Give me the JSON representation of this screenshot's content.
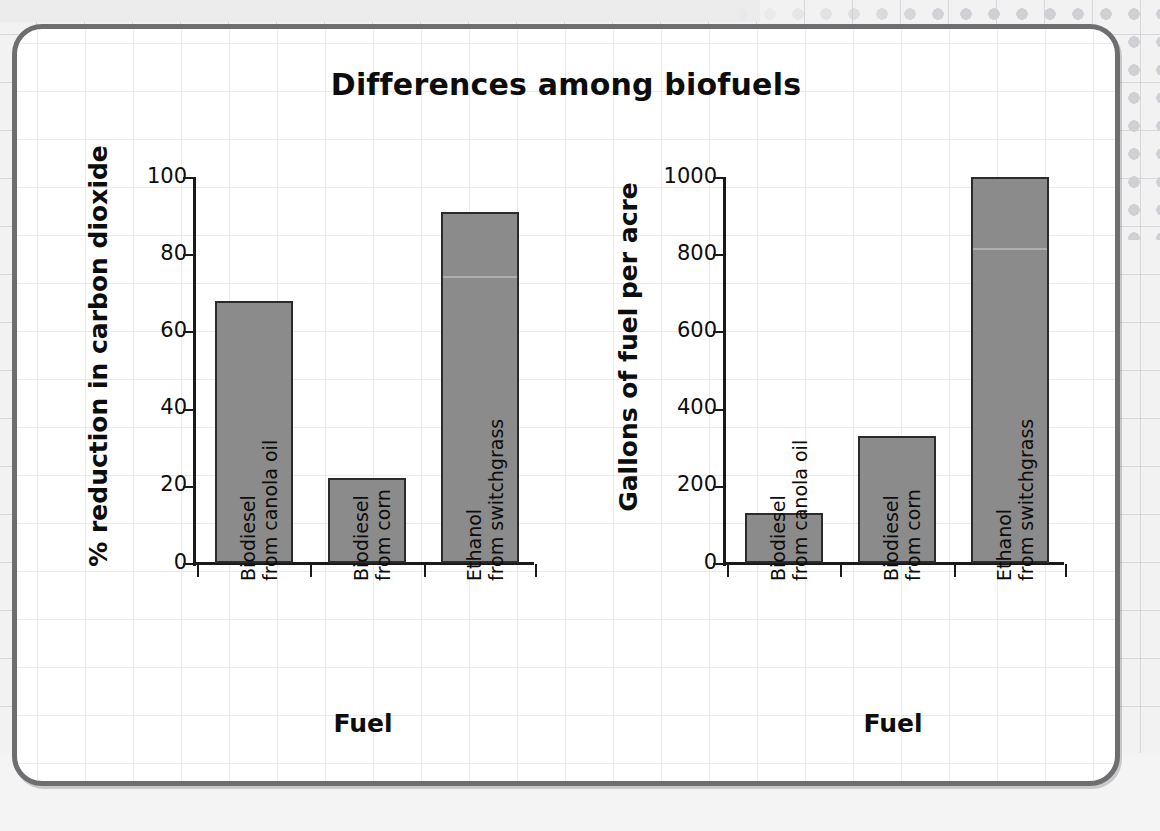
{
  "slide": {
    "title": "Differences among biofuels"
  },
  "chart_data": [
    {
      "id": "left",
      "type": "bar",
      "title": "",
      "xlabel": "Fuel",
      "ylabel": "% reduction in carbon dioxide",
      "ylim": [
        0,
        100
      ],
      "yticks": [
        0,
        20,
        40,
        60,
        80,
        100
      ],
      "ytick_labels": [
        "0",
        "20",
        "40",
        "60",
        "80",
        "100"
      ],
      "grid": true,
      "legend": "none",
      "categories": [
        "Biodiesel from canola oil",
        "Biodiesel from corn",
        "Ethanol from switchgrass"
      ],
      "category_lines": [
        [
          "Biodiesel",
          "from canola oil"
        ],
        [
          "Biodiesel",
          "from corn"
        ],
        [
          "Ethanol",
          "from switchgrass"
        ]
      ],
      "values": [
        68,
        22,
        91
      ],
      "bar_color": "#8b8b8b",
      "bar_edge_color": "#2b2b2b"
    },
    {
      "id": "right",
      "type": "bar",
      "title": "",
      "xlabel": "Fuel",
      "ylabel": "Gallons of fuel per acre",
      "ylim": [
        0,
        1000
      ],
      "yticks": [
        0,
        200,
        400,
        600,
        800,
        1000
      ],
      "ytick_labels": [
        "0",
        "200",
        "400",
        "600",
        "800",
        "1000"
      ],
      "grid": true,
      "legend": "none",
      "categories": [
        "Biodiesel from canola oil",
        "Biodiesel from corn",
        "Ethanol from switchgrass"
      ],
      "category_lines": [
        [
          "Biodiesel",
          "from canola oil"
        ],
        [
          "Biodiesel",
          "from corn"
        ],
        [
          "Ethanol",
          "from switchgrass"
        ]
      ],
      "values": [
        130,
        330,
        1000
      ],
      "bar_color": "#8b8b8b",
      "bar_edge_color": "#2b2b2b"
    }
  ],
  "theme": {
    "card_border": "#6d6e70",
    "grid_line": "#e9eaec",
    "text": "#0d0d0d",
    "axis": "#1a1a1a"
  }
}
